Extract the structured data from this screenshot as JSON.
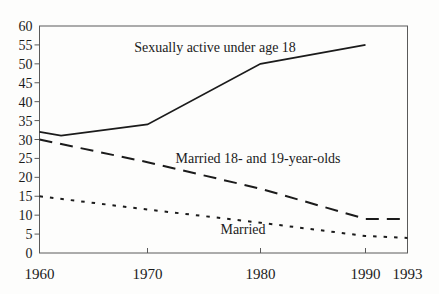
{
  "colors": {
    "background": "#fdfdfc",
    "line": "#1b1b1b",
    "frame": "#5a5a5a",
    "text": "#1b1b1b"
  },
  "chart_data": {
    "type": "line",
    "title": "",
    "xlabel": "",
    "ylabel": "",
    "xlim": [
      1960,
      1993
    ],
    "ylim": [
      0,
      60
    ],
    "grid": false,
    "legend": "inline-annotations-near-lines",
    "y_ticks": [
      0,
      5,
      10,
      15,
      20,
      25,
      30,
      35,
      40,
      45,
      50,
      55,
      60
    ],
    "x_ticks": [
      1960,
      1970,
      1980,
      1990,
      1993
    ],
    "series": [
      {
        "name": "Sexually active under age 18",
        "style": "solid",
        "points": [
          [
            1960,
            32
          ],
          [
            1962,
            31
          ],
          [
            1970,
            34
          ],
          [
            1980,
            50
          ],
          [
            1990,
            55
          ]
        ]
      },
      {
        "name": "Married 18- and 19-year-olds",
        "style": "dashed",
        "points": [
          [
            1960,
            30
          ],
          [
            1970,
            24
          ],
          [
            1980,
            17
          ],
          [
            1990,
            9
          ],
          [
            1993,
            9
          ]
        ]
      },
      {
        "name": "Married",
        "style": "dotted",
        "points": [
          [
            1960,
            15
          ],
          [
            1970,
            11.5
          ],
          [
            1980,
            8
          ],
          [
            1990,
            4.5
          ],
          [
            1993,
            4
          ]
        ]
      }
    ]
  }
}
